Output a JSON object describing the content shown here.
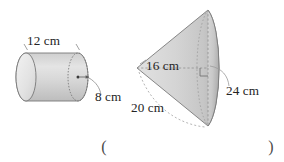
{
  "page": {
    "background_color": "#ffffff",
    "ink_color": "#242424",
    "solid_fill_light": "#e6e6e6",
    "solid_fill_mid": "#d2d2d2",
    "solid_fill_dark": "#bdbdbd",
    "outline_color": "#6f6f6f",
    "hidden_line_color": "#9a9a9a"
  },
  "figures": [
    {
      "id": "cylinder",
      "shape_name": "cylinder",
      "orientation": "horizontal",
      "labels": [
        {
          "key": "length",
          "text": "12 cm",
          "position": "top",
          "value": 12,
          "unit": "cm"
        },
        {
          "key": "radius",
          "text": "8 cm",
          "position": "right-leader",
          "value": 8,
          "unit": "cm"
        }
      ],
      "markers": [
        "center-dot",
        "radius-arrow",
        "extension-ticks",
        "leader-curve"
      ]
    },
    {
      "id": "cone",
      "shape_name": "cone",
      "orientation": "apex-left",
      "labels": [
        {
          "key": "height",
          "text": "16 cm",
          "position": "axis",
          "value": 16,
          "unit": "cm"
        },
        {
          "key": "slant_height",
          "text": "20 cm",
          "position": "lower-left",
          "value": 20,
          "unit": "cm"
        },
        {
          "key": "radius",
          "text": "24 cm",
          "position": "right-leader",
          "value": 24,
          "unit": "cm"
        }
      ],
      "markers": [
        "right-angle-square",
        "dashed-axis",
        "dashed-ellipse",
        "leader-curve"
      ]
    }
  ],
  "answer_blank": {
    "open_paren": "(",
    "close_paren": ")",
    "value": ""
  }
}
